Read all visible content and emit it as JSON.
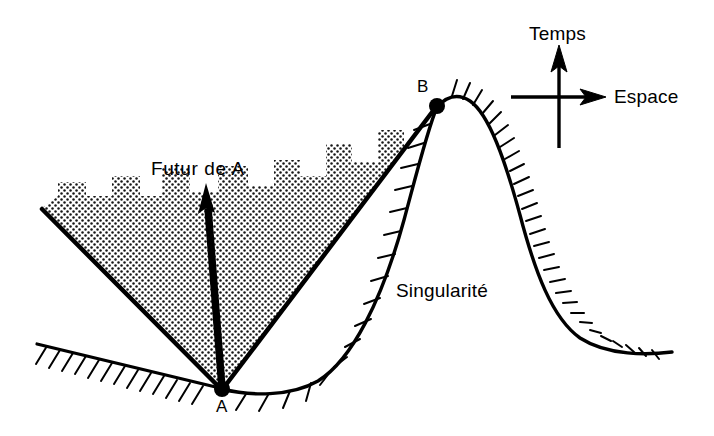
{
  "figure": {
    "width": 714,
    "height": 436,
    "background_color": "#ffffff",
    "ink_color": "#000000"
  },
  "labels": {
    "future_cone": "Futur de A",
    "singularity": "Singularité",
    "axis_time": "Temps",
    "axis_space": "Espace",
    "point_a": "A",
    "point_b": "B"
  },
  "points": {
    "a": {
      "label": "A",
      "x": 222,
      "y": 388
    },
    "b": {
      "label": "B",
      "x": 437,
      "y": 105
    }
  },
  "axes": {
    "origin": {
      "x": 559,
      "y": 97
    },
    "time_arrow": {
      "from_y": 148,
      "to_y": 50,
      "label": "Temps"
    },
    "space_arrow": {
      "from_x": 511,
      "to_x": 603,
      "label": "Espace"
    }
  },
  "regions": {
    "light_cone": {
      "name": "Futur de A",
      "apex": {
        "x": 222,
        "y": 388
      },
      "left_edge_tip": {
        "x": 42,
        "y": 208
      },
      "right_edge_tip": {
        "x": 437,
        "y": 105
      },
      "fill": "stippled-dots",
      "fill_color": "#1a1a1a"
    },
    "singularity_curve": {
      "name": "Singularité",
      "hatching": "inward-tick-marks",
      "stroke_color": "#000000"
    }
  },
  "worldline": {
    "name": "Futur de A arrow",
    "from": {
      "x": 222,
      "y": 388
    },
    "to": {
      "x": 206,
      "y": 188
    },
    "style": "thick-black-arrow"
  }
}
